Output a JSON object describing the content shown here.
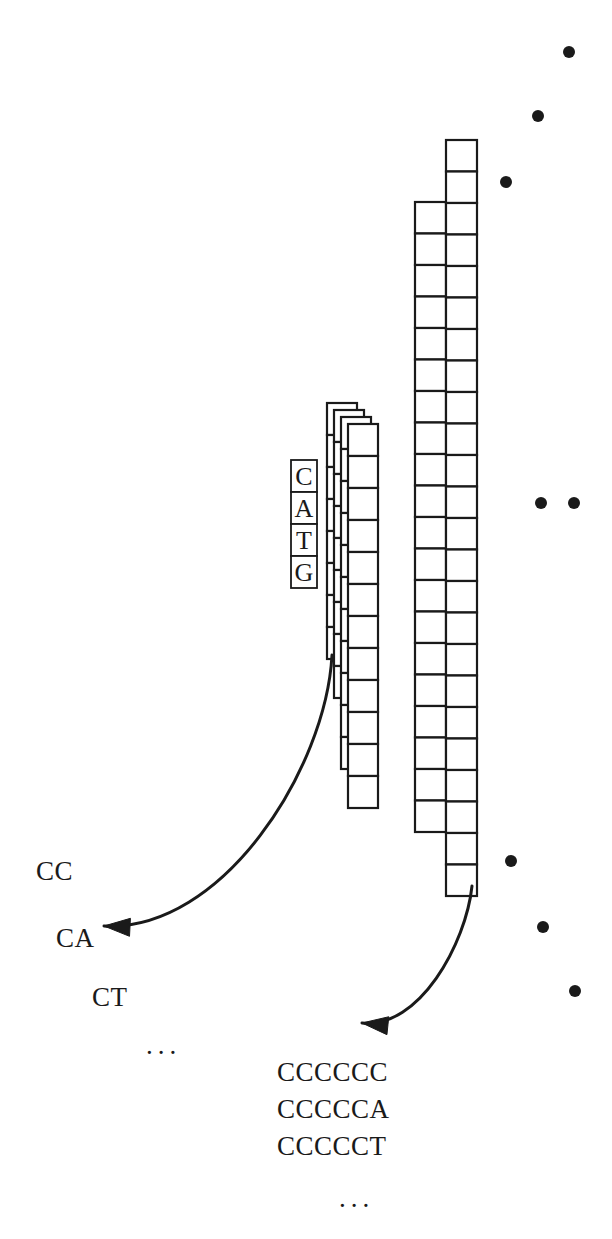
{
  "figure": {
    "background_color": "#ffffff",
    "stroke_color": "#1a1a1a",
    "width": 612,
    "height": 1239
  },
  "base_column": {
    "name": "CATG base column",
    "x": 291,
    "y": 460,
    "cell_width": 26,
    "cell_height": 32,
    "letters": [
      "C",
      "A",
      "T",
      "G"
    ]
  },
  "stacked_columns": {
    "name": "stack of short sequence columns",
    "count": 4,
    "offset_x": 7,
    "offset_y": 7,
    "base_x": 327,
    "base_y": 403,
    "cell_width": 30,
    "cell_height": 32,
    "rows_back": 8,
    "rows_front": 12
  },
  "tall_columns": {
    "name": "pair of tall sequence columns",
    "left": {
      "x": 415,
      "y": 202,
      "cell_width": 31,
      "cell_height": 31.5,
      "rows": 20
    },
    "right": {
      "x": 446,
      "y": 140,
      "cell_width": 31,
      "cell_height": 31.5,
      "rows": 24
    }
  },
  "dots": {
    "name": "ellipsis dots indicating continuation",
    "radius": 6,
    "upper_diagonal": [
      {
        "cx": 569,
        "cy": 52
      },
      {
        "cx": 538,
        "cy": 116
      },
      {
        "cx": 506,
        "cy": 182
      }
    ],
    "middle_horizontal": [
      {
        "cx": 541,
        "cy": 503
      },
      {
        "cx": 574,
        "cy": 503
      }
    ],
    "lower_diagonal": [
      {
        "cx": 511,
        "cy": 861
      },
      {
        "cx": 543,
        "cy": 927
      },
      {
        "cx": 575,
        "cy": 991
      }
    ]
  },
  "arrows": [
    {
      "name": "arrow-to-short-suffixes",
      "from": {
        "x": 332,
        "y": 655
      },
      "to": {
        "x": 104,
        "y": 926
      }
    },
    {
      "name": "arrow-to-long-suffixes",
      "from": {
        "x": 472,
        "y": 886
      },
      "to": {
        "x": 362,
        "y": 1023
      }
    }
  ],
  "short_suffix_list": {
    "name": "short suffix labels",
    "items": [
      {
        "text": "CC",
        "x": 36,
        "y": 856
      },
      {
        "text": "CA",
        "x": 56,
        "y": 923
      },
      {
        "text": "CT",
        "x": 92,
        "y": 982
      }
    ],
    "ellipsis": {
      "text": "...",
      "x": 146,
      "y": 1030
    }
  },
  "long_suffix_list": {
    "name": "long suffix labels",
    "items": [
      {
        "text": "CCCCCC",
        "x": 277,
        "y": 1057
      },
      {
        "text": "CCCCCA",
        "x": 277,
        "y": 1094
      },
      {
        "text": "CCCCCT",
        "x": 277,
        "y": 1131
      }
    ],
    "ellipsis": {
      "text": "...",
      "x": 339,
      "y": 1183
    }
  }
}
